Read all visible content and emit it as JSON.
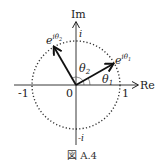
{
  "diagram": {
    "type": "complex-plane-unit-circle",
    "axes": {
      "x_label": "Re",
      "y_label": "Im",
      "origin_label": "0",
      "x_ticks": [
        "-1",
        "1"
      ],
      "y_ticks": [
        "i",
        "-i"
      ]
    },
    "circle": {
      "style": "dotted",
      "radius_units": 1
    },
    "vectors": [
      {
        "label_base": "e",
        "label_sup": "iθ",
        "label_sub": "1",
        "angle_deg": 30
      },
      {
        "label_base": "e",
        "label_sup": "iθ",
        "label_sub": "2",
        "angle_deg": 120
      }
    ],
    "angles": [
      {
        "label": "θ",
        "sub": "1"
      },
      {
        "label": "θ",
        "sub": "2"
      }
    ]
  },
  "caption": "図 A.4"
}
